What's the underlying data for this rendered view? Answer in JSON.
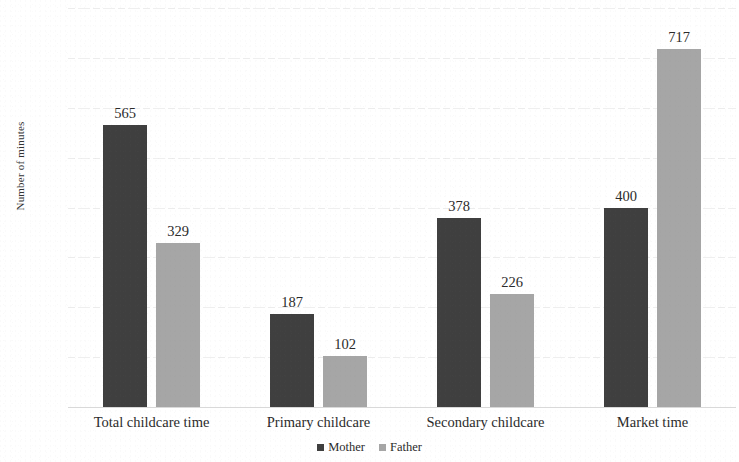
{
  "chart_data": {
    "type": "bar",
    "title": "",
    "xlabel": "",
    "ylabel": "Number of minutes",
    "ylim": [
      0,
      800
    ],
    "ytick_step": 100,
    "yticks": [
      "800",
      "700",
      "600",
      "500",
      "400",
      "300",
      "200",
      "100",
      "0"
    ],
    "grid": true,
    "legend_position": "bottom-center",
    "categories": [
      "Total childcare time",
      "Primary childcare",
      "Secondary childcare",
      "Market time"
    ],
    "series": [
      {
        "name": "Mother",
        "color": "#3f3f3f",
        "values": [
          565,
          187,
          378,
          400
        ],
        "labels": [
          "565",
          "187",
          "378",
          "400"
        ]
      },
      {
        "name": "Father",
        "color": "#a6a6a6",
        "values": [
          329,
          102,
          226,
          717
        ],
        "labels": [
          "329",
          "102",
          "226",
          "717"
        ]
      }
    ]
  },
  "legend": {
    "items": [
      {
        "label": "Mother",
        "color": "#3f3f3f"
      },
      {
        "label": "Father",
        "color": "#a6a6a6"
      }
    ]
  }
}
